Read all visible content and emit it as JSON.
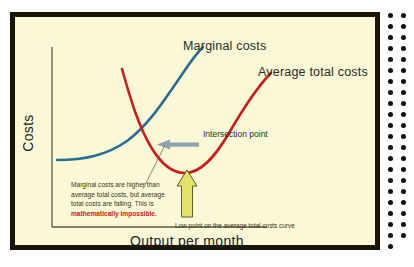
{
  "figure": {
    "background_color": "#fbf8d8",
    "frame_color": "#1a1509",
    "axis_color": "#5d5b46"
  },
  "axes": {
    "y_title": "Costs",
    "x_title": "Output per month"
  },
  "curves": {
    "marginal": {
      "label": "Marginal costs",
      "color": "#2e6c8e"
    },
    "average_total": {
      "label": "Average total costs",
      "color": "#c42020"
    }
  },
  "annotations": {
    "intersection_label": "Intersection point",
    "intersection_arrow_color": "#8fa3ae",
    "low_point_arrow_color": "#e5e06a",
    "note_text": "Marginal costs are higher than average total costs, but average total costs are falling. This is ",
    "note_emphasis": "mathematically impossible.",
    "low_point_caption": "Low point on the average total costs curve"
  },
  "decoration": {
    "dot_color": "#0d0d0d",
    "dot_columns": 2,
    "dot_rows": 22
  },
  "chart_data": {
    "type": "line",
    "title": "",
    "xlabel": "Output per month",
    "ylabel": "Costs",
    "grid": false,
    "legend": "inline-labels",
    "xlim": [
      0,
      100
    ],
    "ylim": [
      0,
      100
    ],
    "series": [
      {
        "name": "Marginal costs",
        "color": "#2e6c8e",
        "x": [
          5,
          15,
          25,
          35,
          45,
          55,
          65,
          72
        ],
        "y": [
          23,
          24,
          27,
          33,
          43,
          57,
          74,
          86
        ]
      },
      {
        "name": "Average total costs",
        "color": "#c42020",
        "x": [
          30,
          36,
          42,
          48,
          54,
          62,
          70,
          80,
          88
        ],
        "y": [
          88,
          68,
          50,
          37,
          31,
          32,
          42,
          60,
          80
        ]
      }
    ],
    "annotations": [
      {
        "text": "Intersection point",
        "x": 44,
        "y": 43,
        "kind": "arrow-left"
      },
      {
        "text": "Low point on the average total costs curve",
        "x": 55,
        "y": 31,
        "kind": "arrow-up"
      },
      {
        "text": "Marginal costs are higher than average total costs, but average total costs are falling. This is mathematically impossible.",
        "x": 20,
        "y": 22,
        "kind": "note"
      }
    ]
  }
}
